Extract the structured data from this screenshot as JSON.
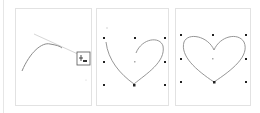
{
  "figure": {
    "panels": [
      {
        "step": 1,
        "content": "single curve segment with tangent handle and pen cursor icon",
        "cursor_icon": "pen-add-anchor-icon"
      },
      {
        "step": 2,
        "content": "half heart with 3x3 grid of guide points"
      },
      {
        "step": 3,
        "content": "completed heart with 3x3 grid of guide points"
      }
    ],
    "colors": {
      "curve": "#8a8a8a",
      "handle": "#d0d0d0",
      "anchor": "#222222",
      "guide_point": "#bdbdbd",
      "frame": "#e2e2e2"
    }
  }
}
